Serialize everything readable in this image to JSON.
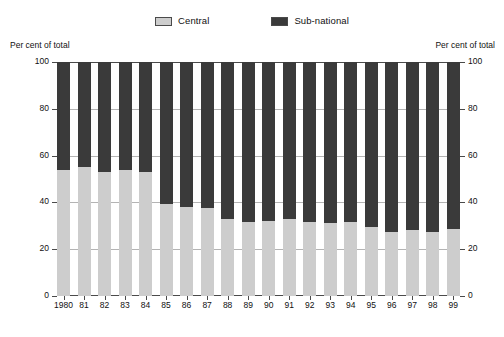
{
  "legend": {
    "entries": [
      {
        "label": "Central",
        "color": "#cdcdcd",
        "name": "central"
      },
      {
        "label": "Sub-national",
        "color": "#3a3a3a",
        "name": "sub-national"
      }
    ]
  },
  "axis_caption_left": "Per cent of total",
  "axis_caption_right": "Per cent of total",
  "yticks": [
    {
      "value": 100,
      "label": "100"
    },
    {
      "value": 80,
      "label": "80"
    },
    {
      "value": 60,
      "label": "60"
    },
    {
      "value": 40,
      "label": "40"
    },
    {
      "value": 20,
      "label": "20"
    },
    {
      "value": 0,
      "label": "0"
    }
  ],
  "chart_data": {
    "type": "bar",
    "stacked": true,
    "title": "",
    "subtitle": "",
    "xlabel": "",
    "ylabel": "Per cent of total",
    "y2label": "Per cent of total",
    "ylim": [
      0,
      100
    ],
    "yticks": [
      0,
      20,
      40,
      60,
      80,
      100
    ],
    "grid": true,
    "legend_position": "top-center",
    "categories": [
      "1980",
      "81",
      "82",
      "83",
      "84",
      "85",
      "86",
      "87",
      "88",
      "89",
      "90",
      "91",
      "92",
      "93",
      "94",
      "95",
      "96",
      "97",
      "98",
      "99"
    ],
    "series": [
      {
        "name": "Central",
        "color": "#cdcdcd",
        "values": [
          54,
          55,
          53,
          54,
          53,
          39.5,
          38,
          37.5,
          33,
          31.5,
          32,
          33,
          31.5,
          31,
          31.5,
          29.5,
          27.5,
          28,
          27.5,
          28.5
        ]
      },
      {
        "name": "Sub-national",
        "color": "#3a3a3a",
        "values": [
          46,
          45,
          47,
          46,
          47,
          60.5,
          62,
          62.5,
          67,
          68.5,
          68,
          67,
          68.5,
          69,
          68.5,
          70.5,
          72.5,
          72,
          72.5,
          71.5
        ]
      }
    ]
  }
}
